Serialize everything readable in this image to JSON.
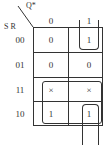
{
  "kmap": {
    "col_var": "Q*",
    "row_var": "S R",
    "col_headers": [
      "0",
      "1"
    ],
    "row_headers": [
      "00",
      "01",
      "11",
      "10"
    ],
    "cells": [
      [
        "0",
        "1"
      ],
      [
        "0",
        "0"
      ],
      [
        "×",
        "×"
      ],
      [
        "1",
        "1"
      ]
    ]
  }
}
